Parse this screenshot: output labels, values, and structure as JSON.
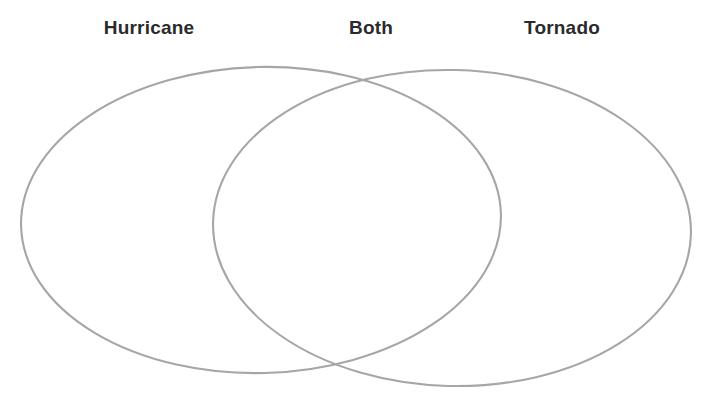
{
  "worksheet": {
    "type": "venn-diagram",
    "background_color": "#ffffff",
    "labels": {
      "left": "Hurricane",
      "center": "Both",
      "right": "Tornado"
    },
    "label_color": "#2b2b2b",
    "stroke_color": "#a6a6a6",
    "regions": [
      {
        "name": "left-only",
        "label": "Hurricane",
        "content": ""
      },
      {
        "name": "overlap",
        "label": "Both",
        "content": ""
      },
      {
        "name": "right-only",
        "label": "Tornado",
        "content": ""
      }
    ],
    "shapes": {
      "left_ellipse": {
        "cx": 261,
        "cy": 220,
        "rx": 240,
        "ry": 153,
        "rotate": -1.5
      },
      "right_ellipse": {
        "cx": 452,
        "cy": 228,
        "rx": 239,
        "ry": 158,
        "rotate": 1.5
      }
    }
  }
}
